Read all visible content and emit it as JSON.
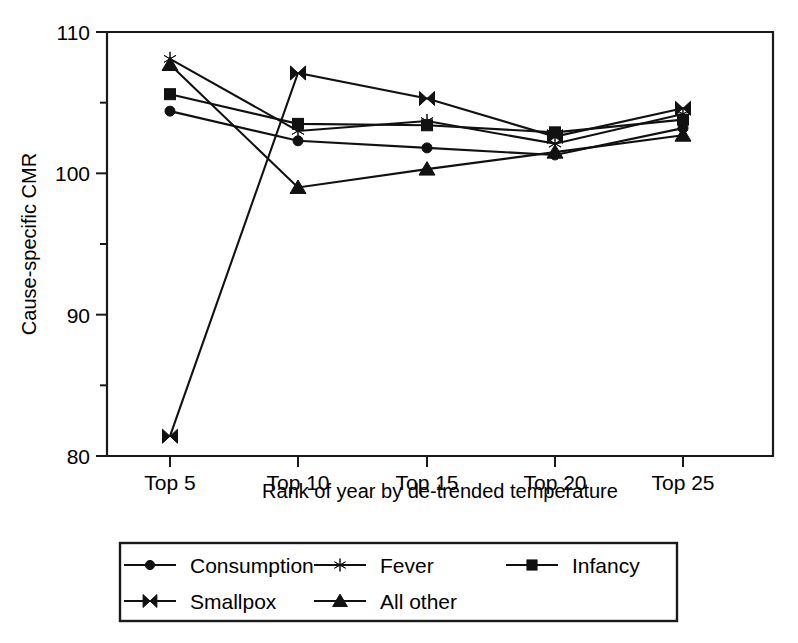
{
  "chart_data": {
    "type": "line",
    "title": "",
    "xlabel": "Rank of year by de-trended temperature",
    "ylabel": "Cause-specific CMR",
    "categories": [
      "Top 5",
      "Top 10",
      "Top 15",
      "Top 20",
      "Top 25"
    ],
    "xticklabels": [
      "Top 5",
      "Top 10",
      "Top 15",
      "Top 20",
      "Top 25"
    ],
    "yticklabels": [
      "80",
      "90",
      "100",
      "110"
    ],
    "ymajorticks": [
      80,
      90,
      100,
      110
    ],
    "yminorticks": [
      85,
      95,
      105
    ],
    "ylim": [
      80,
      110
    ],
    "grid": false,
    "legend_position": "below-axes",
    "series": [
      {
        "name": "Consumption",
        "marker": "circle",
        "values": [
          104.4,
          102.3,
          101.8,
          101.3,
          103.2
        ]
      },
      {
        "name": "Fever",
        "marker": "asterisk",
        "values": [
          108.1,
          103.0,
          103.7,
          102.1,
          104.2
        ]
      },
      {
        "name": "Infancy",
        "marker": "square",
        "values": [
          105.6,
          103.5,
          103.4,
          102.9,
          103.8
        ]
      },
      {
        "name": "Smallpox",
        "marker": "bowtie",
        "values": [
          81.4,
          107.1,
          105.3,
          102.6,
          104.6
        ]
      },
      {
        "name": "All other",
        "marker": "triangle",
        "values": [
          107.7,
          99.0,
          100.3,
          101.5,
          102.7
        ]
      }
    ]
  },
  "legend": {
    "entries": [
      {
        "label": "Consumption",
        "marker": "circle"
      },
      {
        "label": "Fever",
        "marker": "asterisk"
      },
      {
        "label": "Infancy",
        "marker": "square"
      },
      {
        "label": "Smallpox",
        "marker": "bowtie"
      },
      {
        "label": "All other",
        "marker": "triangle"
      }
    ]
  }
}
